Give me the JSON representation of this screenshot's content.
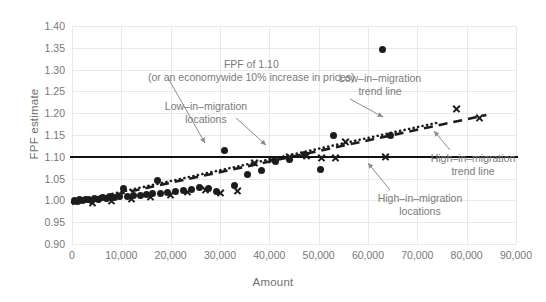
{
  "chart_data": {
    "type": "scatter",
    "title": "",
    "xlabel": "Amount",
    "ylabel": "FPF estimate",
    "xlim": [
      0,
      90000
    ],
    "ylim": [
      0.9,
      1.4
    ],
    "grid": true,
    "legend_position": "none",
    "xticks": [
      "0",
      "10,000",
      "20,000",
      "30,000",
      "40,000",
      "50,000",
      "60,000",
      "70,000",
      "80,000",
      "90,000"
    ],
    "xtick_values": [
      0,
      10000,
      20000,
      30000,
      40000,
      50000,
      60000,
      70000,
      80000,
      90000
    ],
    "yticks": [
      "0.90",
      "0.95",
      "1.00",
      "1.05",
      "1.10",
      "1.15",
      "1.20",
      "1.25",
      "1.30",
      "1.35",
      "1.40"
    ],
    "ytick_values": [
      0.9,
      0.95,
      1.0,
      1.05,
      1.1,
      1.15,
      1.2,
      1.25,
      1.3,
      1.35,
      1.4
    ],
    "reference_line": {
      "label": "FPF of 1.10",
      "y": 1.1,
      "style": "solid",
      "color": "#111111"
    },
    "series": [
      {
        "name": "Low-in-migration locations",
        "marker": "circle",
        "color": "#1c1c1c",
        "points": [
          [
            600,
            1.0
          ],
          [
            1100,
            0.998
          ],
          [
            1600,
            1.002
          ],
          [
            2100,
            0.999
          ],
          [
            2700,
            1.001
          ],
          [
            3300,
            1.003
          ],
          [
            3900,
            1.0
          ],
          [
            4600,
            1.004
          ],
          [
            5300,
            1.002
          ],
          [
            6100,
            1.006
          ],
          [
            6900,
            1.005
          ],
          [
            7800,
            1.008
          ],
          [
            8700,
            1.007
          ],
          [
            9600,
            1.009
          ],
          [
            10400,
            1.028
          ],
          [
            11200,
            1.01
          ],
          [
            12500,
            1.012
          ],
          [
            13800,
            1.011
          ],
          [
            15100,
            1.013
          ],
          [
            16400,
            1.015
          ],
          [
            17400,
            1.045
          ],
          [
            17900,
            1.016
          ],
          [
            19400,
            1.018
          ],
          [
            20900,
            1.02
          ],
          [
            22500,
            1.022
          ],
          [
            24200,
            1.025
          ],
          [
            25900,
            1.03
          ],
          [
            27600,
            1.028
          ],
          [
            29300,
            1.021
          ],
          [
            31000,
            1.114
          ],
          [
            33000,
            1.034
          ],
          [
            35600,
            1.06
          ],
          [
            38400,
            1.068
          ],
          [
            41200,
            1.09
          ],
          [
            44100,
            1.094
          ],
          [
            47200,
            1.105
          ],
          [
            50400,
            1.07
          ],
          [
            53000,
            1.15
          ],
          [
            63000,
            1.345
          ],
          [
            64500,
            1.148
          ]
        ]
      },
      {
        "name": "High-in-migration locations",
        "marker": "x",
        "color": "#1c1c1c",
        "points": [
          [
            4200,
            0.996
          ],
          [
            8000,
            1.0
          ],
          [
            12000,
            1.004
          ],
          [
            16000,
            1.008
          ],
          [
            20000,
            1.013
          ],
          [
            23500,
            1.02
          ],
          [
            27000,
            1.024
          ],
          [
            30000,
            1.018
          ],
          [
            33500,
            1.022
          ],
          [
            37000,
            1.088
          ],
          [
            40500,
            1.094
          ],
          [
            44000,
            1.1
          ],
          [
            47500,
            1.104
          ],
          [
            50500,
            1.099
          ],
          [
            53500,
            1.098
          ],
          [
            55500,
            1.135
          ],
          [
            63500,
            1.1
          ],
          [
            78000,
            1.21
          ],
          [
            82500,
            1.19
          ]
        ]
      }
    ],
    "trend_lines": [
      {
        "name": "Low-in-migration trend line",
        "style": "dotted",
        "color": "#1c1c1c",
        "x0": 0,
        "y0": 0.995,
        "x1": 74000,
        "y1": 1.178
      },
      {
        "name": "High-in-migration trend line",
        "style": "dashed",
        "color": "#1c1c1c",
        "x0": 0,
        "y0": 0.992,
        "x1": 84000,
        "y1": 1.196
      }
    ],
    "annotations": [
      {
        "id": "fpf",
        "line1": "FPF of 1.10",
        "line2": "(or an economywide 10% increase in prices)"
      },
      {
        "id": "low_locations",
        "line1": "Low–in–migration",
        "line2": "locations"
      },
      {
        "id": "low_trend",
        "line1": "Low–in–migration",
        "line2": "trend line"
      },
      {
        "id": "high_locations",
        "line1": "High–in–migration",
        "line2": "locations"
      },
      {
        "id": "high_trend",
        "line1": "High–in–migration",
        "line2": "trend line"
      }
    ],
    "colors": {
      "marker": "#1c1c1c",
      "grid": "#e9e9e9",
      "text": "#777777",
      "annotation_text": "#7a7a7a",
      "reference_line": "#111111",
      "background": "#ffffff"
    }
  }
}
